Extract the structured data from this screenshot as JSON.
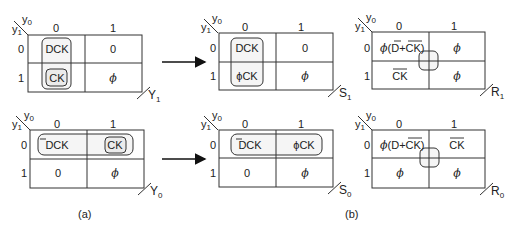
{
  "figure": {
    "panel_a_label": "(a)",
    "panel_b_label": "(b)"
  },
  "axis": {
    "col_var": "y",
    "col_sub": "0",
    "row_var": "y",
    "row_sub": "1",
    "col_headers": [
      "0",
      "1"
    ],
    "row_headers": [
      "0",
      "1"
    ]
  },
  "maps": {
    "Y1": {
      "name": "Y",
      "sub": "1",
      "cells": [
        [
          "DCK",
          "0"
        ],
        [
          "CK",
          "ϕ"
        ]
      ]
    },
    "Y0": {
      "name": "Y",
      "sub": "0",
      "cells": [
        [
          "DCK",
          "CK"
        ],
        [
          "0",
          "ϕ"
        ]
      ],
      "overbar_D_cell_00": true
    },
    "S1": {
      "name": "S",
      "sub": "1",
      "cells": [
        [
          "DCK",
          "0"
        ],
        [
          "ϕCK",
          "ϕ"
        ]
      ]
    },
    "S0": {
      "name": "S",
      "sub": "0",
      "cells": [
        [
          "DCK",
          "ϕCK"
        ],
        [
          "0",
          "ϕ"
        ]
      ],
      "overbar_D_cell_00": true
    },
    "R1": {
      "name": "R",
      "sub": "1",
      "cells": [
        [
          "ϕ(D+CK)",
          "ϕ"
        ],
        [
          "CK",
          "ϕ"
        ]
      ],
      "cell00_parts": {
        "phi": "ϕ",
        "open": "(",
        "d": "D",
        "plus": "+",
        "ck": "CK",
        "close": ")"
      }
    },
    "R0": {
      "name": "R",
      "sub": "0",
      "cells": [
        [
          "ϕ(D+CK)",
          "CK"
        ],
        [
          "ϕ",
          "ϕ"
        ]
      ],
      "cell00_parts": {
        "phi": "ϕ",
        "open": "(",
        "d": "D",
        "plus": "+",
        "ck": "CK",
        "close": ")"
      }
    }
  },
  "arrows": [
    {
      "from": "Y1",
      "to": "S1"
    },
    {
      "from": "Y0",
      "to": "S0"
    }
  ]
}
